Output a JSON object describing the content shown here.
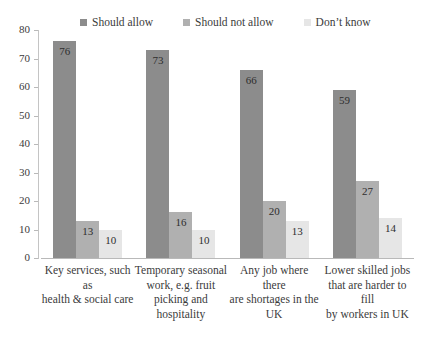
{
  "chart_data": {
    "type": "bar",
    "title": "",
    "subtitle": "",
    "xlabel": "",
    "ylabel": "",
    "ylim": [
      0,
      80
    ],
    "ytick_step": 10,
    "yticks": [
      "0",
      "10",
      "20",
      "30",
      "40",
      "50",
      "60",
      "70",
      "80"
    ],
    "grid": false,
    "legend_position": "top",
    "categories": [
      "Key services, such as health & social care",
      "Temporary seasonal work, e.g. fruit picking and hospitality",
      "Any job where there are shortages in the UK",
      "Lower skilled jobs that are harder to fill by workers in UK"
    ],
    "category_lines": [
      [
        "Key services, such as",
        "health & social care"
      ],
      [
        "Temporary seasonal",
        "work, e.g. fruit",
        "picking and",
        "hospitality"
      ],
      [
        "Any job where there",
        "are shortages in the",
        "UK"
      ],
      [
        "Lower skilled jobs",
        "that are harder to fill",
        "by workers in UK"
      ]
    ],
    "series": [
      {
        "name": "Should allow",
        "color": "#8c8c8c",
        "values": [
          76,
          73,
          66,
          59
        ]
      },
      {
        "name": "Should not allow",
        "color": "#b0b0b0",
        "values": [
          13,
          16,
          20,
          27
        ]
      },
      {
        "name": "Don’t know",
        "color": "#e6e6e6",
        "values": [
          10,
          10,
          13,
          14
        ]
      }
    ]
  },
  "legend": {
    "items": [
      {
        "label": "Should allow"
      },
      {
        "label": "Should not allow"
      },
      {
        "label": "Don’t know"
      }
    ]
  }
}
